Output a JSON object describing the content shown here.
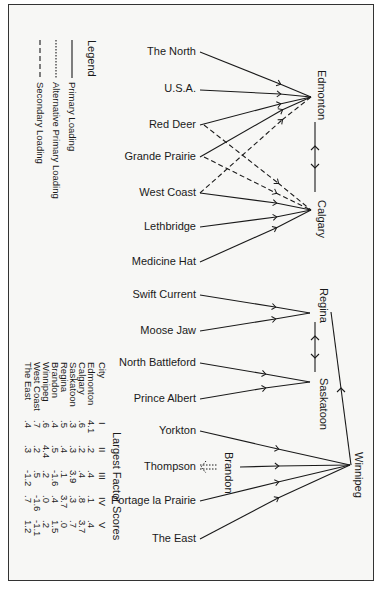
{
  "legend": {
    "title": "Legend",
    "items": [
      {
        "label": "Primary Loading",
        "style": "solid"
      },
      {
        "label": "Alternative Primary Loading",
        "style": "dotted"
      },
      {
        "label": "Secondary Loading",
        "style": "dashed"
      }
    ]
  },
  "hubs": {
    "edmonton": "Edmonton",
    "calgary": "Calgary",
    "regina": "Regina",
    "saskatoon": "Saskatoon",
    "winnipeg": "Winnipeg",
    "brandon": "Brandon"
  },
  "sources": {
    "the_north": "The North",
    "usa": "U.S.A.",
    "red_deer": "Red Deer",
    "grande_prairie": "Grande Prairie",
    "west_coast": "West Coast",
    "lethbridge": "Lethbridge",
    "medicine_hat": "Medicine Hat",
    "swift_current": "Swift Current",
    "moose_jaw": "Moose Jaw",
    "north_battleford": "North Battleford",
    "prince_albert": "Prince Albert",
    "yorkton": "Yorkton",
    "thompson": "Thompson",
    "portage": "Portage la Prairie",
    "the_east": "The East"
  },
  "table": {
    "title": "Largest Factor Scores",
    "headers": [
      "City",
      "I",
      "II",
      "III",
      "IV",
      "V"
    ],
    "rows": [
      [
        "Edmonton",
        "4.1",
        ".2",
        ".4",
        ".1",
        ".4"
      ],
      [
        "Calgary",
        ".6",
        ".2",
        ".4",
        ".8",
        "3.7"
      ],
      [
        "Saskatoon",
        ".3",
        ".3",
        "3.9",
        ".3",
        ".7"
      ],
      [
        "Regina",
        ".5",
        ".4",
        ".1",
        "3.7",
        ".0"
      ],
      [
        "Brandon",
        ".4",
        ".5",
        "-1.6",
        ".4",
        "1.5"
      ],
      [
        "Winnipeg",
        ".6",
        "4.4",
        ".2",
        ".0",
        ".2"
      ],
      [
        "West Coast",
        ".7",
        ".2",
        ".5",
        "-1.6",
        "-1.1"
      ],
      [
        "The East",
        ".4",
        ".3",
        "-1.2",
        ".7",
        "1.2"
      ]
    ]
  }
}
